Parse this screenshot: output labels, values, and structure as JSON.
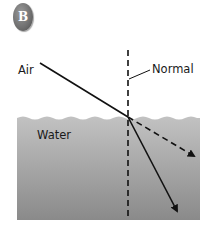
{
  "badge": {
    "letter": "B",
    "color": "#6e6e6e"
  },
  "labels": {
    "air": "Air",
    "normal": "Normal",
    "water": "Water"
  },
  "colors": {
    "water_top": "#bdbdbd",
    "water_bottom": "#8e8e8e",
    "line": "#111111",
    "background": "#ffffff"
  },
  "rays": {
    "incident": {
      "style": "solid",
      "from": [
        40,
        63
      ],
      "to": [
        128,
        117
      ]
    },
    "refracted": {
      "style": "solid-arrow",
      "from": [
        128,
        117
      ],
      "to": [
        178,
        213
      ]
    },
    "reflected_or_undeviated": {
      "style": "dashed-arrow",
      "from": [
        128,
        117
      ],
      "to": [
        196,
        157
      ]
    },
    "normal": {
      "style": "dashed",
      "x": 128,
      "y_top": 50,
      "y_bottom": 218
    }
  }
}
